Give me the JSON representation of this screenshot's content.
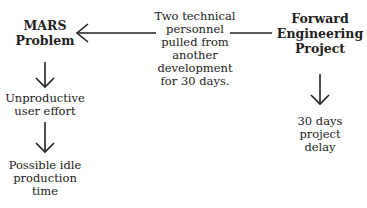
{
  "diagram": {
    "type": "flow",
    "nodes": {
      "mars_problem": "MARS\nProblem",
      "personnel": "Two technical\npersonnel\npulled from\nanother\ndevelopment\nfor 30 days.",
      "forward_project": "Forward\nEngineering\nProject",
      "unproductive": "Unproductive\nuser effort",
      "idle_time": "Possible idle\nproduction\ntime",
      "delay": "30 days\nproject\ndelay"
    },
    "edges": [
      {
        "from": "personnel",
        "to": "mars_problem",
        "style": "arrow"
      },
      {
        "from": "forward_project",
        "to": "personnel",
        "style": "line"
      },
      {
        "from": "mars_problem",
        "to": "unproductive",
        "style": "arrow"
      },
      {
        "from": "unproductive",
        "to": "idle_time",
        "style": "arrow"
      },
      {
        "from": "forward_project",
        "to": "delay",
        "style": "arrow"
      }
    ]
  }
}
